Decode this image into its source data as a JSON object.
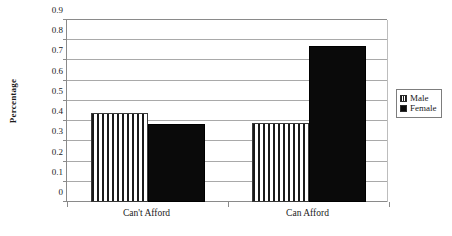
{
  "chart_data": {
    "type": "bar",
    "title": "",
    "xlabel": "",
    "ylabel": "Percentage",
    "categories": [
      "Can't Afford",
      "Can Afford"
    ],
    "series": [
      {
        "name": "Male",
        "values": [
          0.44,
          0.39
        ],
        "pattern": "vertical-stripes",
        "color": "#1a1a1a"
      },
      {
        "name": "Female",
        "values": [
          0.385,
          0.77
        ],
        "pattern": "solid",
        "color": "#0a0a0a"
      }
    ],
    "ylim": [
      0,
      0.9
    ],
    "ytick_labels": [
      "0.9",
      "0.8",
      "0.7",
      "0.6",
      "0.5",
      "0.4",
      "0.3",
      "0.2",
      "0.1",
      "0"
    ],
    "ytick_values": [
      0.9,
      0.8,
      0.7,
      0.6,
      0.5,
      0.4,
      0.3,
      0.2,
      0.1,
      0
    ],
    "grid": true,
    "grid_axis": "y",
    "legend_position": "right"
  },
  "legend": {
    "entries": [
      {
        "label": "Male",
        "swatch": "striped-swatch-icon"
      },
      {
        "label": "Female",
        "swatch": "solid-swatch-icon"
      }
    ]
  },
  "colors": {
    "grid": "#a9a9a9",
    "axis": "#8a8a8a",
    "male": "#1a1a1a",
    "female": "#0a0a0a",
    "background": "#ffffff",
    "text": "#1a1a1a"
  }
}
